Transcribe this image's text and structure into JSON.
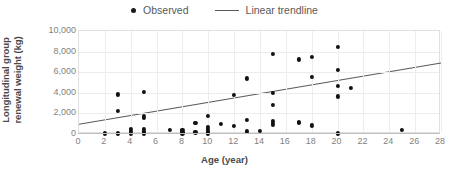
{
  "chart_data": {
    "type": "scatter",
    "title": "",
    "xlabel": "Age (year)",
    "ylabel": "Longitudinal group renewal weight (kg)",
    "xlim": [
      0,
      28
    ],
    "ylim": [
      0,
      10000
    ],
    "xticks": [
      0,
      2,
      4,
      6,
      8,
      10,
      12,
      14,
      16,
      18,
      20,
      22,
      24,
      26,
      28
    ],
    "xtick_labels": [
      "0",
      "2",
      "4",
      "6",
      "8",
      "10",
      "12",
      "14",
      "16",
      "18",
      "20",
      "22",
      "24",
      "26",
      "28"
    ],
    "yticks": [
      0,
      2000,
      4000,
      6000,
      8000,
      10000
    ],
    "ytick_labels": [
      "0",
      "2,000",
      "4,000",
      "6,000",
      "8,000",
      "10,000"
    ],
    "grid": true,
    "legend_position": "top-center",
    "series": [
      {
        "name": "Observed",
        "type": "scatter",
        "marker": "circle",
        "color": "#111111",
        "points": [
          [
            2,
            60
          ],
          [
            3,
            3850
          ],
          [
            3,
            2250
          ],
          [
            3,
            60
          ],
          [
            4,
            500
          ],
          [
            4,
            300
          ],
          [
            4,
            60
          ],
          [
            5,
            4050
          ],
          [
            5,
            1750
          ],
          [
            5,
            1600
          ],
          [
            5,
            500
          ],
          [
            5,
            250
          ],
          [
            5,
            60
          ],
          [
            7,
            430
          ],
          [
            8,
            400
          ],
          [
            8,
            200
          ],
          [
            8,
            60
          ],
          [
            9,
            1100
          ],
          [
            9,
            150
          ],
          [
            10,
            1750
          ],
          [
            10,
            700
          ],
          [
            10,
            500
          ],
          [
            10,
            330
          ],
          [
            10,
            180
          ],
          [
            10,
            60
          ],
          [
            11,
            980
          ],
          [
            12,
            3800
          ],
          [
            12,
            780
          ],
          [
            13,
            5400
          ],
          [
            13,
            1400
          ],
          [
            13,
            260
          ],
          [
            14,
            280
          ],
          [
            15,
            7750
          ],
          [
            15,
            4000
          ],
          [
            15,
            2850
          ],
          [
            15,
            1250
          ],
          [
            15,
            1050
          ],
          [
            15,
            850
          ],
          [
            17,
            7250
          ],
          [
            17,
            1150
          ],
          [
            17,
            1050
          ],
          [
            18,
            7450
          ],
          [
            18,
            5550
          ],
          [
            18,
            830
          ],
          [
            20,
            8450
          ],
          [
            20,
            6200
          ],
          [
            20,
            4650
          ],
          [
            20,
            3650
          ],
          [
            20,
            60
          ],
          [
            21,
            4500
          ],
          [
            25,
            430
          ]
        ]
      },
      {
        "name": "Linear trendline",
        "type": "line",
        "color": "#5a5a5a",
        "endpoints": [
          [
            0,
            950
          ],
          [
            28,
            6900
          ]
        ]
      }
    ],
    "legend": [
      {
        "label": "Observed",
        "marker": "dot",
        "color": "#111111"
      },
      {
        "label": "Linear trendline",
        "marker": "line",
        "color": "#5a5a5a"
      }
    ]
  }
}
